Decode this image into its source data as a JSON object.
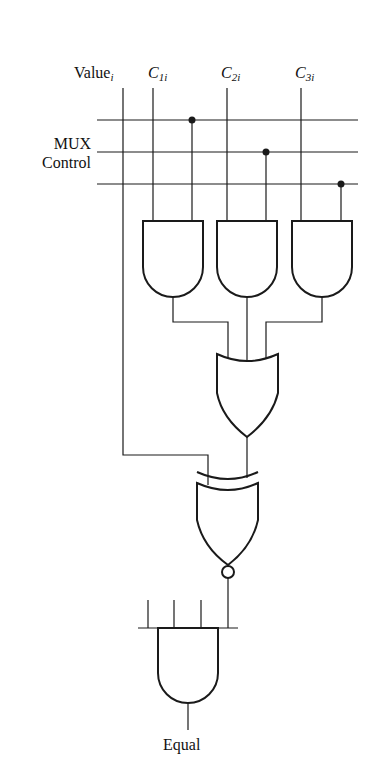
{
  "labels": {
    "value": "Value",
    "value_sub": "i",
    "c1": "C",
    "c1_sub": "1i",
    "c2": "C",
    "c2_sub": "2i",
    "c3": "C",
    "c3_sub": "3i",
    "mux_line1": "MUX",
    "mux_line2": "Control",
    "output": "Equal"
  },
  "components": [
    "and-gate-1",
    "and-gate-2",
    "and-gate-3",
    "or-gate",
    "xnor-gate",
    "final-and-gate"
  ],
  "colors": {
    "stroke": "#1a1a1a",
    "background": "#ffffff"
  }
}
